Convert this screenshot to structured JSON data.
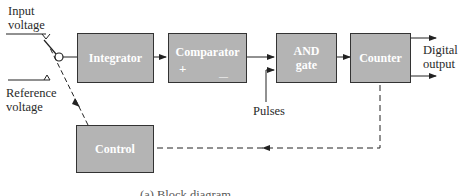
{
  "diagram": {
    "labels": {
      "input_voltage": [
        "Input",
        "voltage"
      ],
      "reference_voltage": [
        "Reference",
        "voltage"
      ],
      "digital_output": [
        "Digital",
        "output"
      ],
      "pulses": "Pulses"
    },
    "blocks": {
      "integrator": "Integrator",
      "comparator": "Comparator",
      "comparator_plus": "+",
      "comparator_minus": "—",
      "and_gate": [
        "AND",
        "gate"
      ],
      "counter": "Counter",
      "control": "Control"
    },
    "caption": "(a) Block diagram",
    "colors": {
      "block_fill": "#b4b4b4",
      "block_border": "#333333",
      "line": "#222222"
    }
  }
}
